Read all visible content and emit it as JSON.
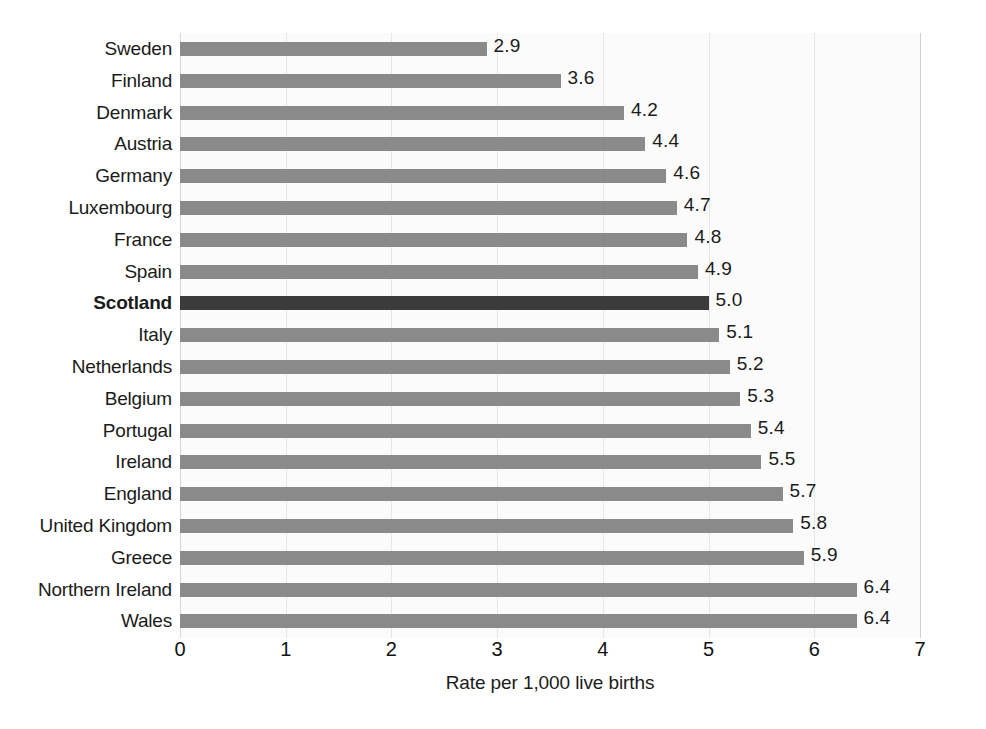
{
  "chart_data": {
    "type": "bar",
    "orientation": "horizontal",
    "title": "",
    "xlabel": "Rate per 1,000 live births",
    "ylabel": "",
    "xlim": [
      0,
      7
    ],
    "xticks": [
      "0",
      "1",
      "2",
      "3",
      "4",
      "5",
      "6",
      "7"
    ],
    "grid": true,
    "legend": null,
    "categories": [
      "Sweden",
      "Finland",
      "Denmark",
      "Austria",
      "Germany",
      "Luxembourg",
      "France",
      "Spain",
      "Scotland",
      "Italy",
      "Netherlands",
      "Belgium",
      "Portugal",
      "Ireland",
      "England",
      "United Kingdom",
      "Greece",
      "Northern Ireland",
      "Wales"
    ],
    "values": [
      2.9,
      3.6,
      4.2,
      4.4,
      4.6,
      4.7,
      4.8,
      4.9,
      5.0,
      5.1,
      5.2,
      5.3,
      5.4,
      5.5,
      5.7,
      5.8,
      5.9,
      6.4,
      6.4
    ],
    "value_labels": [
      "2.9",
      "3.6",
      "4.2",
      "4.4",
      "4.6",
      "4.7",
      "4.8",
      "4.9",
      "5.0",
      "5.1",
      "5.2",
      "5.3",
      "5.4",
      "5.5",
      "5.7",
      "5.8",
      "5.9",
      "6.4",
      "6.4"
    ],
    "highlight_category": "Scotland",
    "colors": {
      "bar": "#8a8a8a",
      "bar_highlight": "#3b3b3b",
      "plot_background": "#fbfbfb",
      "gridline": "#e6e6e6",
      "text": "#1b1b1b",
      "figure_background": "#ffffff"
    }
  }
}
